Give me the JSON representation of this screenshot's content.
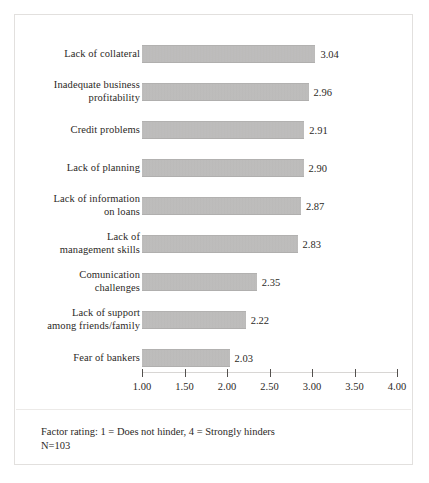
{
  "chart_data": {
    "type": "bar",
    "orientation": "horizontal",
    "title": "",
    "xlabel": "",
    "ylabel": "",
    "categories": [
      "Lack of collateral",
      "Inadequate business profitability",
      "Credit problems",
      "Lack of planning",
      "Lack of information on loans",
      "Lack of management skills",
      "Comunication challenges",
      "Lack of support among friends/family",
      "Fear of bankers"
    ],
    "category_lines": [
      [
        "Lack of collateral"
      ],
      [
        "Inadequate business",
        "profitability"
      ],
      [
        "Credit problems"
      ],
      [
        "Lack of planning"
      ],
      [
        "Lack of information",
        "on loans"
      ],
      [
        "Lack of",
        "management skills"
      ],
      [
        "Comunication",
        "challenges"
      ],
      [
        "Lack of support",
        "among friends/family"
      ],
      [
        "Fear of bankers"
      ]
    ],
    "values": [
      3.04,
      2.96,
      2.91,
      2.9,
      2.87,
      2.83,
      2.35,
      2.22,
      2.03
    ],
    "value_labels": [
      "3.04",
      "2.96",
      "2.91",
      "2.90",
      "2.87",
      "2.83",
      "2.35",
      "2.22",
      "2.03"
    ],
    "xlim": [
      1.0,
      4.0
    ],
    "xticks": [
      1.0,
      1.5,
      2.0,
      2.5,
      3.0,
      3.5,
      4.0
    ],
    "xtick_labels": [
      "1.00",
      "1.50",
      "2.00",
      "2.50",
      "3.00",
      "3.50",
      "4.00"
    ],
    "grid": false,
    "legend": null,
    "bar_color": "#bdbcbb",
    "text_color": "#2c2926"
  },
  "footnote": {
    "line1": "Factor rating: 1 = Does not hinder, 4 = Strongly hinders",
    "line2": "N=103"
  }
}
